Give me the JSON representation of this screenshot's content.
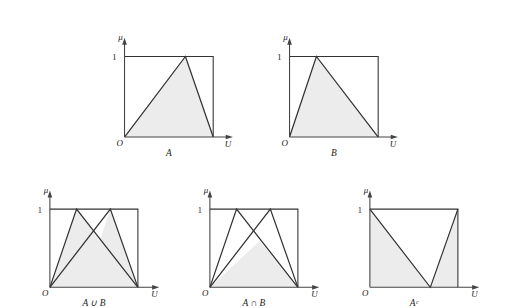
{
  "figure": {
    "fill_color": "#ececec",
    "stroke_color": "#333333",
    "axis_color": "#444444",
    "background": "#ffffff"
  },
  "axis_labels": {
    "mu": "μ",
    "origin": "O",
    "universe": "U",
    "one": "1"
  },
  "panels": [
    {
      "id": "panel-a",
      "caption": "A",
      "x": 112,
      "y": 24,
      "w": 120,
      "h": 124,
      "box": {
        "left": 0,
        "right": 99,
        "top": 22,
        "bottom": 112
      },
      "axis_end": 116,
      "shapes": [
        {
          "name": "membership-triangle-a",
          "filled": true,
          "points": "0,112 68,22 99,112"
        }
      ],
      "curves": [
        {
          "name": "curve-a",
          "points": "0,112 68,22 99,112"
        }
      ]
    },
    {
      "id": "panel-b",
      "caption": "B",
      "x": 277,
      "y": 24,
      "w": 120,
      "h": 124,
      "box": {
        "left": 0,
        "right": 99,
        "top": 22,
        "bottom": 112
      },
      "axis_end": 116,
      "shapes": [
        {
          "name": "membership-triangle-b",
          "filled": true,
          "points": "0,112 30,22 99,112"
        }
      ],
      "curves": [
        {
          "name": "curve-b",
          "points": "0,112 30,22 99,112"
        }
      ]
    },
    {
      "id": "panel-union",
      "caption": "A ∪ B",
      "x": 37,
      "y": 186,
      "w": 120,
      "h": 112,
      "box": {
        "left": 0,
        "right": 99,
        "top": 12,
        "bottom": 100
      },
      "axis_end": 118,
      "shapes": [
        {
          "name": "union-region",
          "filled": true,
          "points": "0,100 30,12 56,48 68,12 99,100"
        }
      ],
      "curves": [
        {
          "name": "curve-a",
          "points": "0,100 68,12 99,100"
        },
        {
          "name": "curve-b",
          "points": "0,100 30,12 99,100"
        }
      ]
    },
    {
      "id": "panel-intersection",
      "caption": "A ∩ B",
      "x": 197,
      "y": 186,
      "w": 120,
      "h": 112,
      "box": {
        "left": 0,
        "right": 99,
        "top": 12,
        "bottom": 100
      },
      "axis_end": 118,
      "shapes": [
        {
          "name": "intersection-region",
          "filled": true,
          "points": "0,100 56,48 99,100"
        }
      ],
      "curves": [
        {
          "name": "curve-a",
          "points": "0,100 68,12 99,100"
        },
        {
          "name": "curve-b",
          "points": "0,100 30,12 99,100"
        }
      ]
    },
    {
      "id": "panel-complement",
      "caption": "Aᶜ",
      "x": 357,
      "y": 186,
      "w": 120,
      "h": 112,
      "box": {
        "left": 0,
        "right": 99,
        "top": 12,
        "bottom": 100
      },
      "axis_end": 118,
      "shapes": [
        {
          "name": "complement-region",
          "filled": true,
          "points": "0,12 68,100 99,12 99,100 0,100"
        }
      ],
      "curves": [
        {
          "name": "curve-a-complement",
          "points": "0,12 68,100 99,12"
        }
      ]
    }
  ]
}
